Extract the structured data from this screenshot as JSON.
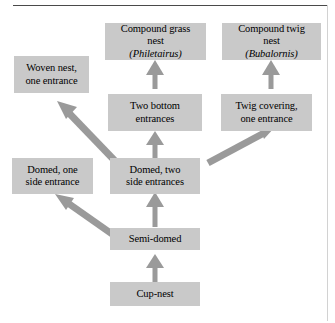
{
  "figure": {
    "background_color": "#ffffff",
    "box_fill_color": "#c9c9c9",
    "arrow_color": "#9a9a9a",
    "rule_color": "#4a4a4a"
  },
  "nodes": {
    "compound_grass_nest": {
      "line1": "Compound grass",
      "line2_prefix": "nest ",
      "line2_genus": "(Philetairus)"
    },
    "compound_twig_nest": {
      "line1": "Compound twig",
      "line2_prefix": "nest ",
      "line2_genus": "(Bubalornis)"
    },
    "woven_nest": {
      "line1": "Woven nest,",
      "line2": "one entrance"
    },
    "two_bottom_entrances": {
      "line1": "Two bottom",
      "line2": "entrances"
    },
    "twig_covering": {
      "line1": "Twig covering,",
      "line2": "one entrance"
    },
    "domed_one_side": {
      "line1": "Domed, one",
      "line2": "side entrance"
    },
    "domed_two_side": {
      "line1": "Domed, two",
      "line2": "side entrances"
    },
    "semi_domed": {
      "line1": "Semi-domed"
    },
    "cup_nest": {
      "line1": "Cup-nest"
    }
  },
  "edges": [
    {
      "from": "cup_nest",
      "to": "semi_domed",
      "direction": "up"
    },
    {
      "from": "semi_domed",
      "to": "domed_two_side",
      "direction": "up"
    },
    {
      "from": "semi_domed",
      "to": "domed_one_side",
      "direction": "up-left"
    },
    {
      "from": "domed_two_side",
      "to": "woven_nest",
      "direction": "up-left"
    },
    {
      "from": "domed_two_side",
      "to": "two_bottom_entrances",
      "direction": "up"
    },
    {
      "from": "domed_two_side",
      "to": "twig_covering",
      "direction": "up-right"
    },
    {
      "from": "two_bottom_entrances",
      "to": "compound_grass_nest",
      "direction": "up"
    },
    {
      "from": "twig_covering",
      "to": "compound_twig_nest",
      "direction": "up"
    }
  ]
}
